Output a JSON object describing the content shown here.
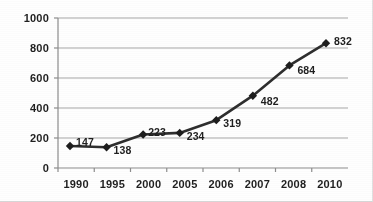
{
  "chart_data": {
    "type": "line",
    "title": "",
    "xlabel": "",
    "ylabel": "",
    "categories": [
      "1990",
      "1995",
      "2000",
      "2005",
      "2006",
      "2007",
      "2008",
      "2010"
    ],
    "values": [
      147,
      138,
      223,
      234,
      319,
      482,
      684,
      832
    ],
    "point_labels": [
      "147",
      "138",
      "223",
      "234",
      "319",
      "482",
      "684",
      "832"
    ],
    "ylim": [
      0,
      1000
    ],
    "ytick_labels": [
      "0",
      "200",
      "400",
      "600",
      "800",
      "1000"
    ],
    "ytick_values": [
      0,
      200,
      400,
      600,
      800,
      1000
    ],
    "grid": "horizontal",
    "legend": "none",
    "marker": "diamond",
    "series": [
      {
        "name": "series-1",
        "values": [
          147,
          138,
          223,
          234,
          319,
          482,
          684,
          832
        ]
      }
    ],
    "colors": {
      "line": "#2b2b2b",
      "marker": "#1a1a1a",
      "grid": "#a6a6a6",
      "axis": "#8c8c8c",
      "text": "#1c1c1c",
      "background": "#ffffff"
    }
  }
}
